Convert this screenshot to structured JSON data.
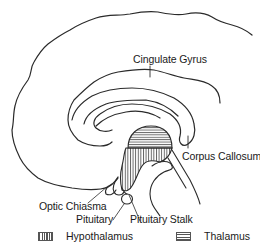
{
  "diagram": {
    "type": "anatomical-section",
    "labels": {
      "cingulate_gyrus": "Cingulate Gyrus",
      "corpus_callosum": "Corpus Callosum",
      "optic_chiasma": "Optic Chiasma",
      "pituitary": "Pituitary",
      "pituitary_stalk": "Pituitary Stalk"
    },
    "legend": [
      {
        "pattern": "vertical-hatch",
        "label": "Hypothalamus"
      },
      {
        "pattern": "horizontal-hatch",
        "label": "Thalamus"
      }
    ],
    "colors": {
      "line": "#2a2a2a",
      "background": "#ffffff"
    }
  }
}
